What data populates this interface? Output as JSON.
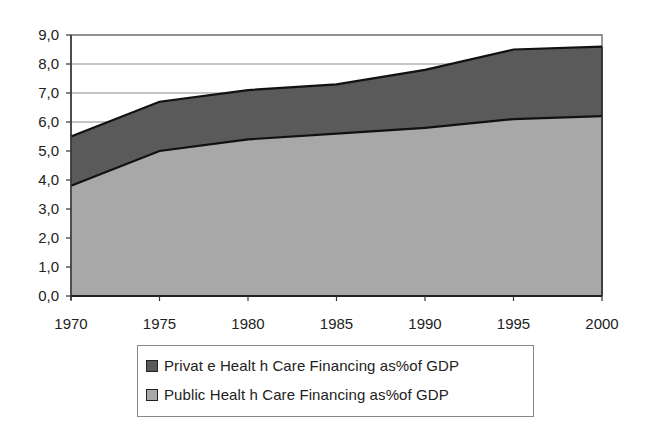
{
  "chart_data": {
    "type": "area",
    "stacked": true,
    "title": "",
    "xlabel": "",
    "ylabel": "",
    "categories": [
      "1970",
      "1975",
      "1980",
      "1985",
      "1990",
      "1995",
      "2000"
    ],
    "series": [
      {
        "name": "Public Health Care Financing as%of GDP",
        "color": "#a8a8a8",
        "values": [
          3.8,
          5.0,
          5.4,
          5.6,
          5.8,
          6.1,
          6.2
        ]
      },
      {
        "name": "Privat e Healt h Care Financing as%of GDP",
        "color": "#5a5a5a",
        "values": [
          1.7,
          1.7,
          1.7,
          1.7,
          2.0,
          2.4,
          2.4
        ]
      }
    ],
    "totals": [
      5.5,
      6.7,
      7.1,
      7.3,
      7.8,
      8.5,
      8.6
    ],
    "ylim": [
      0,
      9
    ],
    "yticks": [
      "0,0",
      "1,0",
      "2,0",
      "3,0",
      "4,0",
      "5,0",
      "6,0",
      "7,0",
      "8,0",
      "9,0"
    ],
    "grid": true,
    "legend_position": "bottom"
  },
  "legend": {
    "items": [
      {
        "label": "Privat e Healt h Care Financing as%of GDP",
        "color": "#5a5a5a"
      },
      {
        "label": "Public Healt h Care Financing as%of GDP",
        "color": "#a8a8a8"
      }
    ]
  }
}
